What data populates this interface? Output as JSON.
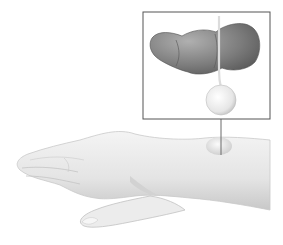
{
  "figure": {
    "inset": {
      "label": "magnified view",
      "box": {
        "x": 143,
        "y": 12,
        "width": 127,
        "height": 107
      },
      "border_color": "#555555"
    },
    "leader_line": {
      "x": 221,
      "y1": 119,
      "y2": 155,
      "color": "#6a6a6a"
    },
    "colors": {
      "background": "#ffffff",
      "skin_light": "#f2f2f2",
      "skin_mid": "#d9d9d9",
      "skin_shadow": "#b5b5b5",
      "joint_dark": "#6e6e6e",
      "joint_mid": "#9a9a9a",
      "cyst_light": "#fafafa",
      "cyst_shadow": "#c4c4c4"
    }
  }
}
